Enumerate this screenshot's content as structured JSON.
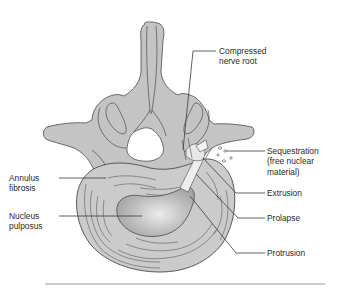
{
  "figure": {
    "colors": {
      "bone": "#c4c4c4",
      "disc": "#cbcbcb",
      "nucleus_dark": "#a9a9a9",
      "nucleus_light": "#e6e6e6",
      "outline": "#4a4a4a",
      "leader": "#3a3a3a",
      "rule": "#9a9a9a"
    }
  },
  "labels": {
    "compressed_nerve_root": "Compressed\nnerve root",
    "sequestration": "Sequestration\n(free nuclear\nmaterial)",
    "extrusion": "Extrusion",
    "prolapse": "Prolapse",
    "protrusion": "Protrusion",
    "annulus_fibrosis": "Annulus\nfibrosis",
    "nucleus_pulposus": "Nucleus\npulposus"
  }
}
